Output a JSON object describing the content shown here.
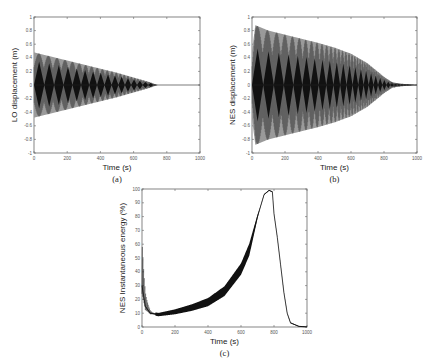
{
  "chart_data": [
    {
      "id": "a",
      "type": "line",
      "caption": "(a)",
      "xlabel": "Time (s)",
      "ylabel": "LO displacement (m)",
      "xlim": [
        0,
        1000
      ],
      "ylim": [
        -1,
        1
      ],
      "xticks": [
        0,
        200,
        400,
        600,
        800,
        1000
      ],
      "yticks": [
        -1,
        -0.8,
        -0.6,
        -0.4,
        -0.2,
        0,
        0.2,
        0.4,
        0.6,
        0.8,
        1
      ],
      "description": "Beating oscillation with linearly decaying envelope from ~0.48 at t=0 to 0 at t≈740 s, then flat at zero",
      "envelope": {
        "x": [
          0,
          100,
          200,
          300,
          400,
          500,
          600,
          700,
          740,
          1000
        ],
        "upper": [
          0.48,
          0.42,
          0.36,
          0.3,
          0.24,
          0.18,
          0.11,
          0.04,
          0.0,
          0.0
        ]
      }
    },
    {
      "id": "b",
      "type": "line",
      "caption": "(b)",
      "xlabel": "Time (s)",
      "ylabel": "NES displacement (m)",
      "xlim": [
        0,
        1000
      ],
      "ylim": [
        -1,
        1
      ],
      "xticks": [
        0,
        200,
        400,
        600,
        800,
        1000
      ],
      "yticks": [
        -1,
        -0.8,
        -0.6,
        -0.4,
        -0.2,
        0,
        0.2,
        0.4,
        0.6,
        0.8,
        1
      ],
      "description": "Beating oscillation, peak ~0.88 near t≈20 s, envelope decaying to ~0 by t≈900 s with small residual ripples",
      "envelope": {
        "x": [
          0,
          20,
          100,
          200,
          300,
          400,
          500,
          600,
          700,
          750,
          800,
          850,
          900,
          1000
        ],
        "upper": [
          0.5,
          0.88,
          0.8,
          0.74,
          0.68,
          0.62,
          0.55,
          0.46,
          0.32,
          0.22,
          0.12,
          0.04,
          0.02,
          0.0
        ]
      }
    },
    {
      "id": "c",
      "type": "line",
      "caption": "(c)",
      "xlabel": "Time (s)",
      "ylabel": "NES Instantaneous energy (%)",
      "xlim": [
        0,
        1000
      ],
      "ylim": [
        0,
        100
      ],
      "xticks": [
        0,
        200,
        400,
        600,
        800,
        1000
      ],
      "yticks": [
        0,
        10,
        20,
        30,
        40,
        50,
        60,
        70,
        80,
        90,
        100
      ],
      "x": [
        0,
        20,
        50,
        100,
        200,
        300,
        400,
        500,
        600,
        650,
        700,
        740,
        770,
        790,
        800,
        820,
        840,
        860,
        880,
        900,
        950,
        1000
      ],
      "values": [
        30,
        15,
        10,
        9,
        11,
        14,
        18,
        26,
        42,
        56,
        80,
        96,
        99,
        98,
        82,
        65,
        45,
        25,
        10,
        3,
        0.5,
        0
      ]
    }
  ]
}
